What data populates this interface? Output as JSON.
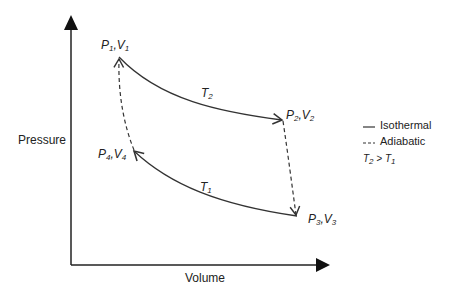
{
  "axes": {
    "y_label": "Pressure",
    "x_label": "Volume"
  },
  "points": [
    {
      "id": "p1",
      "P": "P",
      "Ps": "1",
      "V": "V",
      "Vs": "1"
    },
    {
      "id": "p2",
      "P": "P",
      "Ps": "2",
      "V": "V",
      "Vs": "2"
    },
    {
      "id": "p3",
      "P": "P",
      "Ps": "3",
      "V": "V",
      "Vs": "3"
    },
    {
      "id": "p4",
      "P": "P",
      "Ps": "4",
      "V": "V",
      "Vs": "4"
    }
  ],
  "curves": {
    "hot": {
      "T": "T",
      "sub": "2"
    },
    "cold": {
      "T": "T",
      "sub": "1"
    }
  },
  "legend": {
    "isothermal": "Isothermal",
    "adiabatic": "Adiabatic",
    "relation": {
      "a": "T",
      "as": "2",
      "op": " > ",
      "b": "T",
      "bs": "1"
    }
  },
  "colors": {
    "line": "#333333"
  }
}
